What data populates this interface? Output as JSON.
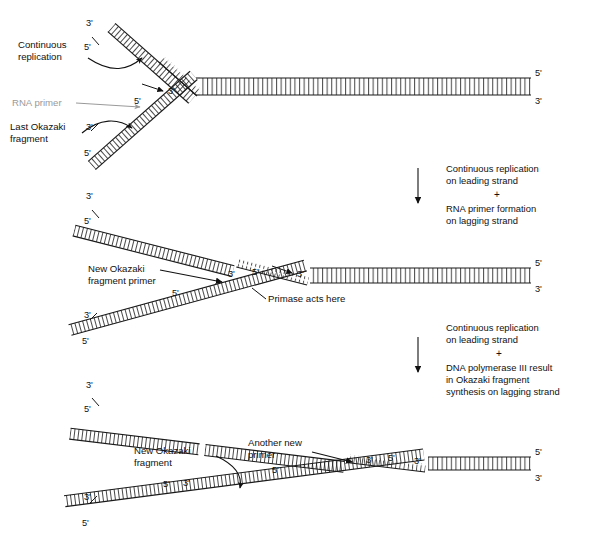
{
  "figure": {
    "background_color": "#ffffff",
    "line_color": "#1a1a1a",
    "rna_primer_color": "#9a9a9a"
  },
  "panel1": {
    "labels": {
      "continuous_replication_line1": "Continuous",
      "continuous_replication_line2": "replication",
      "rna_primer": "RNA primer",
      "last_okazaki_line1": "Last Okazaki",
      "last_okazaki_line2": "fragment"
    },
    "ends": {
      "top_left_upper": "3ʹ",
      "top_left_lower": "5ʹ",
      "fork_center": "3ʹ",
      "lagging_primer_5": "5ʹ",
      "bottom_left_upper": "3ʹ",
      "bottom_left_lower": "5ʹ",
      "right_upper": "5ʹ",
      "right_lower": "3ʹ"
    }
  },
  "transition1": {
    "line1": "Continuous replication",
    "line2": "on leading strand",
    "plus": "+",
    "line3": "RNA primer formation",
    "line4": "on lagging strand"
  },
  "panel2": {
    "labels": {
      "new_okazaki_primer_line1": "New Okazaki",
      "new_okazaki_primer_line2": "fragment primer",
      "primase": "Primase acts here"
    },
    "ends": {
      "top_left_upper": "3ʹ",
      "top_left_lower": "5ʹ",
      "primer_left_3": "3ʹ",
      "primer_right_5": "5ʹ",
      "fork_center": "3ʹ",
      "lagging_5": "5ʹ",
      "bottom_left_upper": "3ʹ",
      "bottom_left_lower": "5ʹ",
      "right_upper": "5ʹ",
      "right_lower": "3ʹ"
    }
  },
  "transition2": {
    "line1": "Continuous replication",
    "line2": "on leading strand",
    "plus": "+",
    "line3": "DNA polymerase III result",
    "line4": "in Okazaki fragment",
    "line5": "synthesis on lagging strand"
  },
  "panel3": {
    "labels": {
      "new_okazaki_line1": "New Okazaki",
      "new_okazaki_line2": "fragment",
      "another_primer_line1": "Another new",
      "another_primer_line2": "primer"
    },
    "ends": {
      "top_left_upper": "3ʹ",
      "top_left_lower": "5ʹ",
      "junction_5": "5ʹ",
      "junction_3": "3ʹ",
      "primer_left_3": "3ʹ",
      "primer_right_5": "5ʹ",
      "fork_center": "3ʹ",
      "lagging_5": "5ʹ",
      "bottom_left_upper": "3ʹ",
      "bottom_left_lower": "5ʹ",
      "right_upper": "5ʹ",
      "right_lower": "3ʹ"
    }
  }
}
